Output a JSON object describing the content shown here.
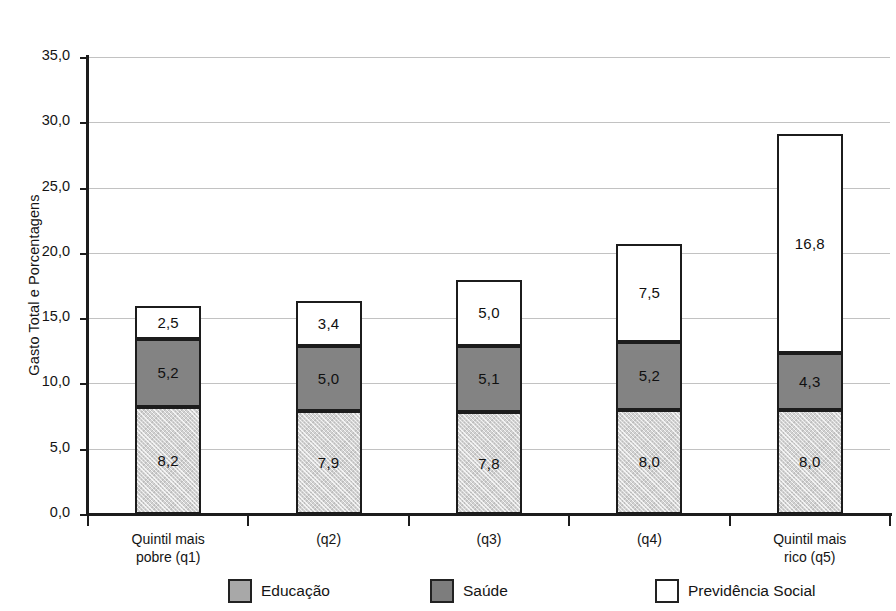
{
  "chart_data": {
    "type": "bar",
    "subtype": "stacked-vertical",
    "title": "",
    "xlabel": "",
    "ylabel": "Gasto Total e Porcentagens",
    "ylim": [
      0,
      35
    ],
    "ytick_step": 5,
    "ytick_labels": [
      "35,0",
      "30,0",
      "25,0",
      "20,0",
      "15,0",
      "10,0",
      "5,0",
      "0,0"
    ],
    "ytick_values": [
      35,
      30,
      25,
      20,
      15,
      10,
      5,
      0
    ],
    "grid": true,
    "grid_axis": "y",
    "legend_position": "bottom",
    "decimal_separator": ",",
    "categories": [
      "Quintil mais pobre (q1)",
      "(q2)",
      "(q3)",
      "(q4)",
      "Quintil mais rico (q5)"
    ],
    "category_lines": [
      [
        "Quintil mais",
        "pobre (q1)"
      ],
      [
        "(q2)"
      ],
      [
        "(q3)"
      ],
      [
        "(q4)"
      ],
      [
        "Quintil mais",
        "rico (q5)"
      ]
    ],
    "series": [
      {
        "name": "Educação",
        "color": "#d2d2d2",
        "values": [
          8.2,
          7.9,
          7.8,
          8.0,
          8.0
        ],
        "labels": [
          "8,2",
          "7,9",
          "7,8",
          "8,0",
          "8,0"
        ]
      },
      {
        "name": "Saúde",
        "color": "#838383",
        "values": [
          5.2,
          5.0,
          5.1,
          5.2,
          4.3
        ],
        "labels": [
          "5,2",
          "5,0",
          "5,1",
          "5,2",
          "4,3"
        ]
      },
      {
        "name": "Previdência Social",
        "color": "#ffffff",
        "values": [
          2.5,
          3.4,
          5.0,
          7.5,
          16.8
        ],
        "labels": [
          "2,5",
          "3,4",
          "5,0",
          "7,5",
          "16,8"
        ]
      }
    ],
    "totals": [
      15.9,
      16.3,
      17.9,
      20.7,
      29.1
    ]
  },
  "legend": {
    "items": [
      {
        "label": "Educação",
        "swatch": "educacao"
      },
      {
        "label": "Saúde",
        "swatch": "saude"
      },
      {
        "label": "Previdência Social",
        "swatch": "previdencia"
      }
    ]
  },
  "colors": {
    "educacao": "#d2d2d2",
    "saude": "#838383",
    "previdencia": "#ffffff",
    "axis": "#1c1c1c",
    "grid": "#c2c2c2",
    "text": "#141414"
  }
}
